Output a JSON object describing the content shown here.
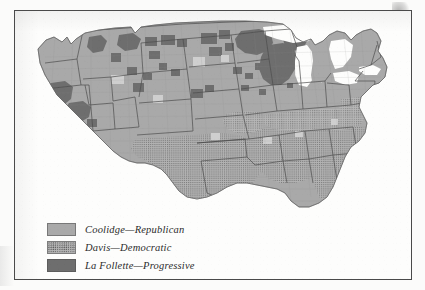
{
  "plate": {
    "kind": "county-level-electoral-map",
    "region_label": "Continental United States"
  },
  "legend": {
    "items": [
      {
        "swatch": "coolidge-swatch",
        "label": "Coolidge—Republican",
        "fill": "#a9a9a9",
        "pattern": "solid"
      },
      {
        "swatch": "davis-swatch",
        "label": "Davis—Democratic",
        "fill": "#b4b4b4",
        "pattern": "stipple-dots"
      },
      {
        "swatch": "lafollette-swatch",
        "label": "La Follette—Progressive",
        "fill": "#6e6e6e",
        "pattern": "solid"
      }
    ]
  },
  "map_colors": {
    "coolidge": "#a9a9a9",
    "davis": "#b4b4b4",
    "lafollette": "#6e6e6e",
    "water": "#fdfdfc",
    "state_border": "#5a5a5a",
    "county_border": "#9a9a9a",
    "frame": "#4a4a4a",
    "paper": "#fbfbfa"
  },
  "map_regions": {
    "coolidge_dominant": [
      "Pacific Coast",
      "Great Basin",
      "Northern Plains",
      "Great Lakes",
      "Ohio Valley",
      "Northeast",
      "New England"
    ],
    "davis_dominant": [
      "Texas",
      "Oklahoma",
      "Arkansas",
      "Louisiana",
      "Mississippi",
      "Alabama",
      "Georgia",
      "Florida",
      "South Carolina",
      "North Carolina",
      "Tennessee",
      "Kentucky",
      "Virginia"
    ],
    "lafollette_strongholds": [
      "Wisconsin",
      "Northern Minnesota",
      "North Dakota",
      "Montana",
      "Northern Idaho",
      "Washington Cascades",
      "Northern California",
      "Nevada",
      "Upper Michigan",
      "Iowa"
    ]
  }
}
